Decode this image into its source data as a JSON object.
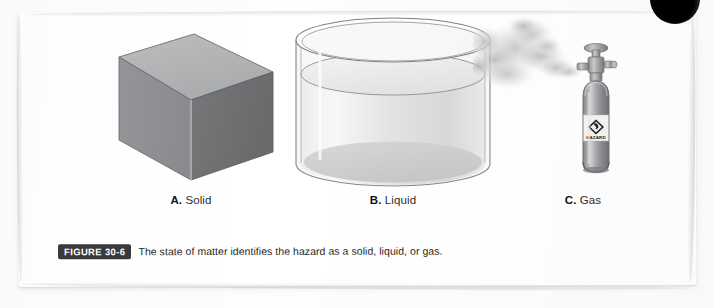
{
  "figure": {
    "badge_label": "FIGURE 30-6",
    "caption_text": "The state of matter identifies the hazard as a solid, liquid, or gas.",
    "panels": [
      {
        "letter": "A",
        "name": "Solid",
        "label_letter": "A.",
        "label_text": " Solid",
        "art": "gray-cube",
        "colors": {
          "top_face": "#b0b2b4",
          "left_face": "#8e9093",
          "right_face": "#6f7174",
          "outline": "#5e6063"
        }
      },
      {
        "letter": "B",
        "name": "Liquid",
        "label_letter": "B.",
        "label_text": " Liquid",
        "art": "transparent-cylinder-with-liquid",
        "colors": {
          "glass_outline": "#8d8f92",
          "liquid_surface": "#e6e7e8",
          "liquid_body": "#d9dadb",
          "vessel_bottom": "#c9cacb"
        }
      },
      {
        "letter": "C",
        "name": "Gas",
        "label_letter": "C.",
        "label_text": " Gas",
        "art": "gas-cylinder-venting-smoke",
        "cylinder_label_text": "HAZARD",
        "colors": {
          "tank_body": "#9a9c9e",
          "tank_highlight": "#cfd1d2",
          "tank_shadow": "#6d6f71",
          "valve": "#a8aaac",
          "label_plate": "#f2f2f0",
          "smoke": "#c9cbcd"
        }
      }
    ]
  },
  "page": {
    "background_color": "#ffffff",
    "sheet_color": "#ffffff",
    "corner_mark": "dark-circle"
  }
}
